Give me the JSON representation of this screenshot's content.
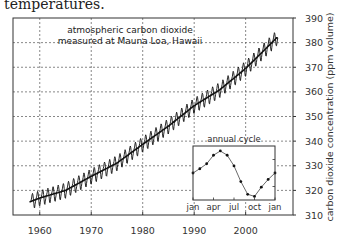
{
  "caption": "temperatures.",
  "chart_data": [
    {
      "type": "line",
      "title": "atmospheric carbon dioxide measured at Mauna Loa, Hawaii",
      "title_lines": [
        "atmospheric carbon dioxide",
        "measured at Mauna Loa, Hawaii"
      ],
      "xlabel": "",
      "ylabel": "carbon dioxide concentration (ppm volume)",
      "xlim": [
        1954.8,
        2009.2
      ],
      "ylim": [
        310,
        390
      ],
      "x_ticks": [
        1960,
        1970,
        1980,
        1990,
        2000
      ],
      "x_tick_labels": [
        "1960",
        "1970",
        "1980",
        "1990",
        "2000"
      ],
      "y_ticks": [
        310,
        320,
        330,
        340,
        350,
        360,
        370,
        380,
        390
      ],
      "y_tick_labels": [
        "310",
        "320",
        "330",
        "340",
        "350",
        "360",
        "370",
        "380",
        "390"
      ],
      "y_axis_position": "right",
      "grid": true,
      "grid_style": "dashed",
      "series": [
        {
          "name": "annual mean (trend)",
          "x": [
            1958,
            1960,
            1965,
            1970,
            1975,
            1980,
            1985,
            1990,
            1995,
            2000,
            2005,
            2006
          ],
          "values": [
            315.3,
            316.9,
            320.0,
            325.7,
            331.1,
            338.7,
            346.1,
            354.4,
            360.9,
            369.5,
            379.8,
            381.9
          ]
        },
        {
          "name": "monthly values (seasonal oscillation)",
          "description": "monthly CO2 oscillating around the trend with ~+/-3 ppm annual amplitude",
          "amplitude_ppm": 3.2,
          "x_range": [
            1958,
            2006
          ]
        }
      ],
      "color": "#111111"
    },
    {
      "type": "line",
      "title": "annual cycle",
      "inset": true,
      "categories": [
        "jan",
        "feb",
        "mar",
        "apr",
        "may",
        "jun",
        "jul",
        "aug",
        "sep",
        "oct",
        "nov",
        "dec",
        "jan"
      ],
      "x_tick_labels": [
        "jan",
        "apr",
        "jul",
        "oct",
        "jan"
      ],
      "values": [
        0.0,
        0.6,
        1.3,
        2.5,
        3.1,
        2.5,
        1.0,
        -1.2,
        -3.0,
        -3.3,
        -2.0,
        -0.9,
        0.0
      ],
      "ylim": [
        -3.8,
        3.8
      ],
      "markers": true,
      "color": "#111111"
    }
  ]
}
